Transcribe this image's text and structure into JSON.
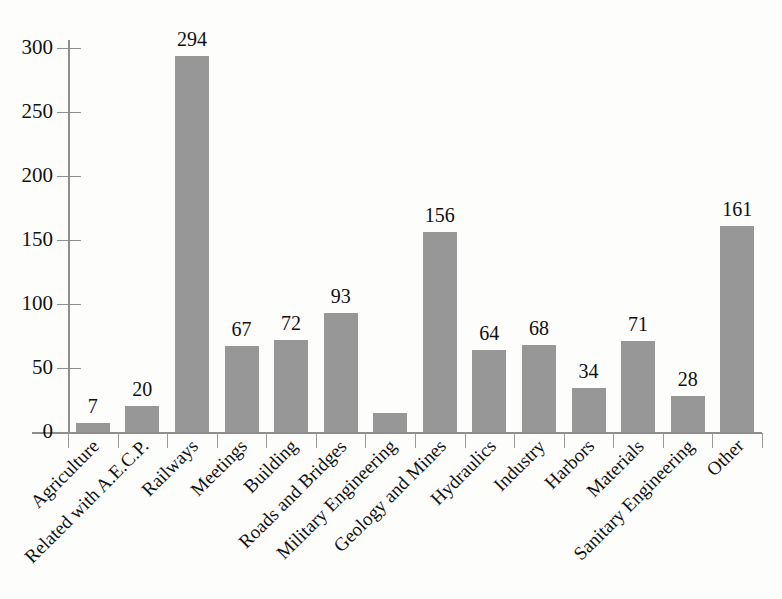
{
  "chart_data": {
    "type": "bar",
    "title": "",
    "xlabel": "",
    "ylabel": "",
    "ylim": [
      0,
      300
    ],
    "ytick_step": 50,
    "yticks": [
      0,
      50,
      100,
      150,
      200,
      250,
      300
    ],
    "grid": false,
    "legend": null,
    "bar_color": "#979797",
    "axis_color": "#8e8e8e",
    "categories": [
      "Agriculture",
      "Related with A.E.C.P.",
      "Railways",
      "Meetings",
      "Building",
      "Roads and Bridges",
      "Military Engineering",
      "Geology and Mines",
      "Hydraulics",
      "Industry",
      "Harbors",
      "Materials",
      "Sanitary Engineering",
      "Other"
    ],
    "values": [
      7,
      20,
      294,
      67,
      72,
      93,
      15,
      156,
      64,
      68,
      34,
      71,
      28,
      161
    ],
    "data_labels": [
      "7",
      "20",
      "294",
      "67",
      "72",
      "93",
      "",
      "156",
      "64",
      "68",
      "34",
      "71",
      "28",
      "161"
    ]
  }
}
